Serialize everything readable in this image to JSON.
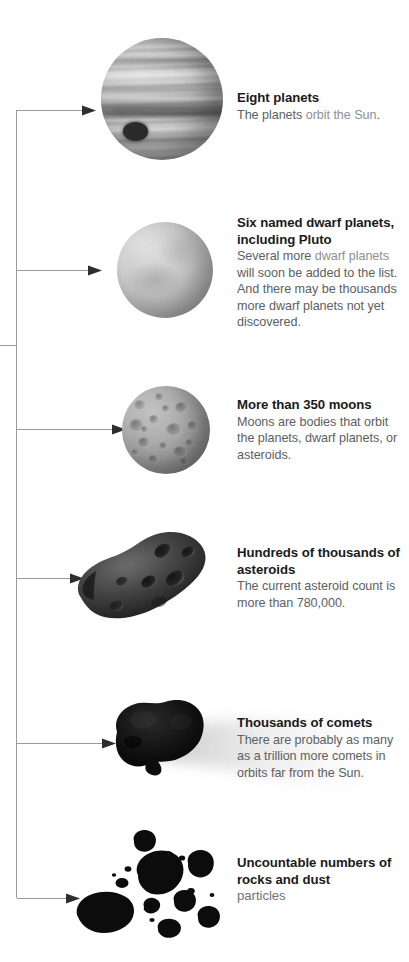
{
  "diagram": {
    "accent_color": "#1a1a1a",
    "body_color": "#5c6063",
    "link_color": "#8b9094",
    "line_color": "#9a9a9a",
    "background": "#ffffff"
  },
  "branches": [
    {
      "id": "planets",
      "icon": "jupiter-planet-image",
      "heading": "Eight planets",
      "body_parts": [
        {
          "text": "The planets ",
          "style": "normal"
        },
        {
          "text": "orbit the Sun",
          "style": "link"
        },
        {
          "text": ".",
          "style": "normal"
        }
      ]
    },
    {
      "id": "dwarf-planets",
      "icon": "dwarf-planet-image",
      "heading": "Six named dwarf planets, including Pluto",
      "body_parts": [
        {
          "text": "Several more ",
          "style": "normal"
        },
        {
          "text": "dwarf planets",
          "style": "link"
        },
        {
          "text": " will soon be added to the list. And there may be thousands more dwarf planets not yet discovered.",
          "style": "normal"
        }
      ]
    },
    {
      "id": "moons",
      "icon": "moon-image",
      "heading": "More than 350 moons",
      "body_parts": [
        {
          "text": "Moons are bodies that orbit the planets, dwarf planets, or asteroids.",
          "style": "normal"
        }
      ]
    },
    {
      "id": "asteroids",
      "icon": "asteroid-image",
      "heading": "Hundreds of thousands of asteroids",
      "body_parts": [
        {
          "text": "The current asteroid count is more than 780,000.",
          "style": "normal"
        }
      ]
    },
    {
      "id": "comets",
      "icon": "comet-image",
      "heading": "Thousands of comets",
      "body_parts": [
        {
          "text": "There are probably as many as a trillion more comets in orbits far from the Sun.",
          "style": "normal"
        }
      ]
    },
    {
      "id": "rocks-and-dust",
      "icon": "rocks-and-dust-image",
      "heading": "Uncountable numbers of rocks and dust",
      "heading_suffix": "particles",
      "body_parts": []
    }
  ]
}
